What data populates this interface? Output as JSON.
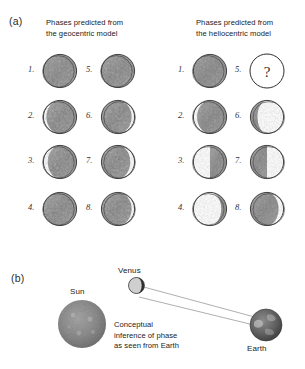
{
  "figure": {
    "panel_a": {
      "label": "(a)",
      "columns": [
        {
          "id": "geocentric",
          "heading_line1": "Phases predicted from",
          "heading_line2": "the geocentric model",
          "phases": [
            {
              "num": "1.",
              "kind": "full",
              "illum": 1.0,
              "lit_side": "none"
            },
            {
              "num": "2.",
              "kind": "gibbous",
              "illum": 0.9,
              "lit_side": "right"
            },
            {
              "num": "3.",
              "kind": "gibbous",
              "illum": 0.86,
              "lit_side": "right"
            },
            {
              "num": "4.",
              "kind": "full",
              "illum": 0.97,
              "lit_side": "right"
            },
            {
              "num": "5.",
              "kind": "full",
              "illum": 1.0,
              "lit_side": "none"
            },
            {
              "num": "6.",
              "kind": "gibbous",
              "illum": 0.9,
              "lit_side": "left"
            },
            {
              "num": "7.",
              "kind": "gibbous",
              "illum": 0.86,
              "lit_side": "left"
            },
            {
              "num": "8.",
              "kind": "gibbous",
              "illum": 0.9,
              "lit_side": "left"
            }
          ]
        },
        {
          "id": "heliocentric",
          "heading_line1": "Phases predicted from",
          "heading_line2": "the heliocentric model",
          "phases": [
            {
              "num": "1.",
              "kind": "full",
              "illum": 1.0,
              "lit_side": "none"
            },
            {
              "num": "2.",
              "kind": "gibbous",
              "illum": 0.88,
              "lit_side": "right"
            },
            {
              "num": "3.",
              "kind": "half",
              "illum": 0.5,
              "lit_side": "right"
            },
            {
              "num": "4.",
              "kind": "crescent",
              "illum": 0.17,
              "lit_side": "right"
            },
            {
              "num": "5.",
              "kind": "question",
              "illum": 0.0,
              "lit_side": "none",
              "glyph": "?"
            },
            {
              "num": "6.",
              "kind": "crescent",
              "illum": 0.22,
              "lit_side": "left"
            },
            {
              "num": "7.",
              "kind": "half",
              "illum": 0.5,
              "lit_side": "left"
            },
            {
              "num": "8.",
              "kind": "gibbous",
              "illum": 0.84,
              "lit_side": "left"
            }
          ]
        }
      ]
    },
    "panel_b": {
      "label": "(b)",
      "bodies": [
        {
          "id": "sun",
          "label": "Sun"
        },
        {
          "id": "venus",
          "label": "Venus"
        },
        {
          "id": "earth",
          "label": "Earth"
        }
      ],
      "caption_line1": "Conceptual",
      "caption_line2": "inference of phase",
      "caption_line3": "as seen from Earth"
    }
  },
  "colors": {
    "ink": "#1a1a1a",
    "text": "#222222",
    "shade_dark": "#6a6a6a",
    "shade_mid": "#8c8c8c",
    "outline": "#2e2e2e",
    "paper": "#ffffff"
  }
}
